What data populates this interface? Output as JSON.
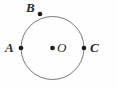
{
  "figure": {
    "type": "geometry-diagram",
    "background_color": "#fefefe",
    "stroke_color": "#7a7a7a",
    "point_color": "#1a1a1a",
    "label_color": "#2b2b2b",
    "canvas": {
      "width": 117,
      "height": 89
    },
    "circle": {
      "center_x": 52.5,
      "center_y": 48,
      "radius": 31.5,
      "stroke_width": 1
    },
    "points": [
      {
        "id": "A",
        "label": "A",
        "x": 21,
        "y": 48,
        "radius": 2.3,
        "on_circle": true,
        "label_x": 5,
        "label_y": 41
      },
      {
        "id": "B",
        "label": "B",
        "x": 40,
        "y": 14,
        "radius": 2.3,
        "on_circle": true,
        "label_x": 26,
        "label_y": 1
      },
      {
        "id": "C",
        "label": "C",
        "x": 84,
        "y": 48,
        "radius": 2.3,
        "on_circle": true,
        "label_x": 90,
        "label_y": 41
      },
      {
        "id": "O",
        "label": "O",
        "x": 52.5,
        "y": 48,
        "radius": 2.3,
        "on_circle": false,
        "label_x": 57,
        "label_y": 41
      }
    ]
  }
}
